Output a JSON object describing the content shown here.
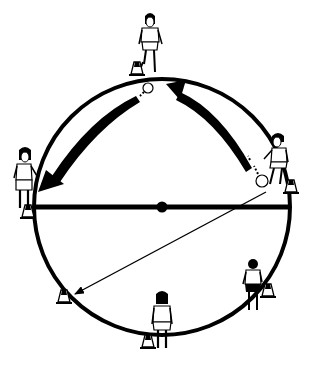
{
  "diagram": {
    "type": "soccer-passing-drill",
    "colors": {
      "ink": "#000000",
      "paper": "#ffffff"
    },
    "field": {
      "shape": "circle",
      "center": [
        162,
        207
      ],
      "radius": 128,
      "diameter_line": {
        "from": [
          34,
          207
        ],
        "to": [
          290,
          207
        ]
      },
      "center_mark": [
        162,
        207
      ]
    },
    "players": [
      {
        "id": "top",
        "position": [
          150,
          42
        ],
        "facing": "down"
      },
      {
        "id": "right",
        "position": [
          278,
          160
        ],
        "facing": "left"
      },
      {
        "id": "left",
        "position": [
          24,
          182
        ],
        "facing": "right"
      },
      {
        "id": "bottom",
        "position": [
          162,
          318
        ],
        "facing": "up"
      },
      {
        "id": "bottom-right",
        "position": [
          253,
          284
        ],
        "facing": "up"
      }
    ],
    "cones": [
      {
        "id": "cone-top",
        "position": [
          137,
          69
        ]
      },
      {
        "id": "cone-right",
        "position": [
          291,
          187
        ]
      },
      {
        "id": "cone-left",
        "position": [
          28,
          212
        ]
      },
      {
        "id": "cone-bottom-left",
        "position": [
          64,
          297
        ]
      },
      {
        "id": "cone-bottom",
        "position": [
          148,
          342
        ]
      },
      {
        "id": "cone-bottom-right",
        "position": [
          268,
          291
        ]
      }
    ],
    "balls": [
      {
        "id": "ball-top",
        "position": [
          148,
          88
        ]
      },
      {
        "id": "ball-right",
        "position": [
          262,
          181
        ]
      }
    ],
    "arrows": [
      {
        "id": "pass-right-to-top",
        "style": "thick-curved",
        "from": [
          258,
          172
        ],
        "to": [
          172,
          86
        ]
      },
      {
        "id": "pass-top-to-left",
        "style": "thick-curved",
        "from": [
          142,
          92
        ],
        "to": [
          40,
          190
        ]
      },
      {
        "id": "pass-right-to-bottom-left",
        "style": "thin-straight",
        "from": [
          266,
          192
        ],
        "to": [
          73,
          295
        ]
      }
    ]
  }
}
